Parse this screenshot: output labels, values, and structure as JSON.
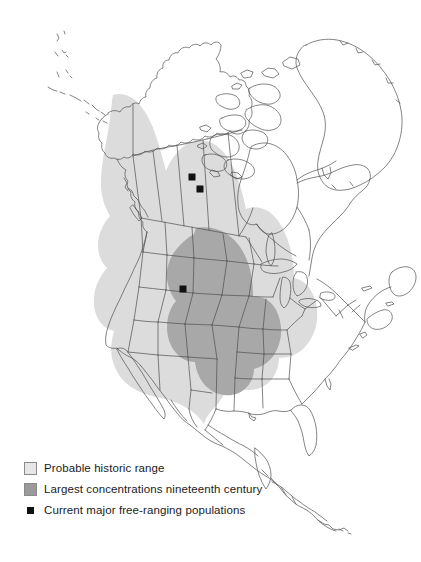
{
  "figure": {
    "kind": "thematic-range-map",
    "region": "North America",
    "background_color": "#ffffff",
    "outline_color": "#4f4f4f"
  },
  "map": {
    "layers": [
      {
        "id": "probable-historic-range",
        "name": "Probable historic range",
        "color": "#dcdcdc"
      },
      {
        "id": "largest-concentrations",
        "name": "Largest concentrations nineteenth century",
        "color": "#a8a8a8"
      }
    ],
    "markers": {
      "name": "Current major free-ranging populations",
      "color": "#111111",
      "size": 7,
      "points": [
        {
          "id": "marker-1",
          "x": 192,
          "y": 177
        },
        {
          "id": "marker-2",
          "x": 200,
          "y": 189
        },
        {
          "id": "marker-3",
          "x": 183,
          "y": 289
        }
      ]
    }
  },
  "legend": {
    "items": [
      {
        "id": "probable-historic-range",
        "label": "Probable historic range",
        "swatch": "light-gray-square",
        "color": "#e6e6e6"
      },
      {
        "id": "largest-concentrations",
        "label": "Largest concentrations nineteenth century",
        "swatch": "medium-gray-square",
        "color": "#9a9a9a"
      },
      {
        "id": "current-populations",
        "label": "Current major free-ranging populations",
        "swatch": "black-square-marker",
        "color": "#111111"
      }
    ]
  }
}
